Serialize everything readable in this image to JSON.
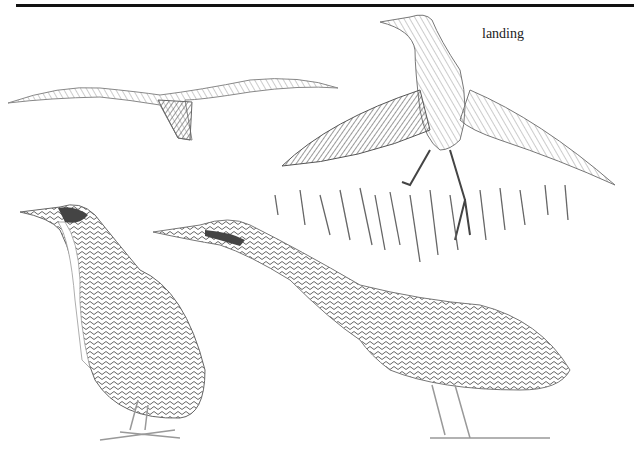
{
  "figure": {
    "caption": "landing",
    "subjects": [
      "bittern in flight",
      "bittern landing",
      "bittern standing",
      "bittern stalking"
    ],
    "colors": {
      "ink": "#222222",
      "shade": "#777777",
      "light": "#bbbbbb",
      "paper": "#ffffff"
    }
  }
}
